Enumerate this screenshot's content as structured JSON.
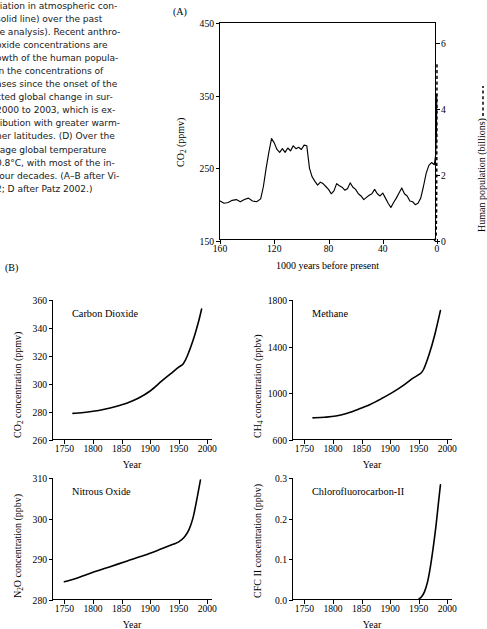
{
  "caption": {
    "lines": [
      "riation in atmospheric con-",
      "solid line) over the past",
      "re analysis). Recent anthro-",
      "oxide concentrations are",
      "owth of the human popula-",
      "in the concentrations of",
      "ases since the onset of the",
      "cted global change in sur-",
      "2000 to 2003, which is ex-",
      "ribution with greater warm-",
      "her latitudes. (D) Over the",
      "rage global temperature",
      "0.8°C, with most of the in-",
      "four decades. (A–B after Vi-",
      "2; D after Patz 2002.)"
    ]
  },
  "panels": {
    "a_letter": "(A)",
    "b_letter": "(B)"
  },
  "chart_data": [
    {
      "id": "panel-a",
      "type": "line",
      "title": "",
      "xlabel": "1000 years before present",
      "ylabel": "CO2 (ppmv)",
      "ylabel_display": "CO₂ (ppmv)",
      "y2label": "Human population (billions)",
      "y2label_legend": "dotted-line",
      "xlim": [
        160,
        0
      ],
      "ylim": [
        150,
        450
      ],
      "y2lim": [
        0,
        6.6
      ],
      "xticks": [
        160,
        120,
        80,
        40,
        0
      ],
      "yticks": [
        150,
        250,
        350,
        450
      ],
      "y2ticks": [
        0,
        2,
        4,
        6
      ],
      "grid": false,
      "frame": true,
      "series": [
        {
          "name": "CO2 concentration",
          "style": "solid",
          "x": [
            160,
            157,
            154,
            151,
            148,
            145,
            142,
            139,
            136,
            133,
            130,
            128,
            126,
            124,
            122,
            120,
            118,
            116,
            114,
            112,
            110,
            108,
            106,
            104,
            102,
            100,
            98,
            96,
            94,
            92,
            90,
            88,
            86,
            84,
            82,
            80,
            78,
            76,
            74,
            72,
            70,
            68,
            66,
            64,
            62,
            60,
            58,
            56,
            54,
            52,
            50,
            48,
            46,
            44,
            42,
            40,
            38,
            36,
            34,
            32,
            30,
            28,
            26,
            24,
            22,
            20,
            18,
            16,
            14,
            12,
            10,
            8,
            6,
            4,
            2,
            1,
            0.4,
            0.2,
            0
          ],
          "y": [
            205,
            202,
            203,
            206,
            207,
            204,
            207,
            209,
            205,
            204,
            208,
            225,
            250,
            272,
            291,
            285,
            276,
            272,
            277,
            272,
            278,
            274,
            281,
            277,
            279,
            276,
            282,
            281,
            250,
            238,
            232,
            227,
            231,
            229,
            225,
            221,
            215,
            219,
            229,
            226,
            224,
            220,
            222,
            230,
            224,
            221,
            215,
            212,
            207,
            210,
            213,
            215,
            221,
            215,
            212,
            216,
            209,
            202,
            196,
            203,
            209,
            216,
            223,
            215,
            212,
            205,
            204,
            200,
            202,
            209,
            225,
            243,
            254,
            258,
            255,
            268,
            300,
            352,
            352
          ]
        },
        {
          "name": "Human population",
          "style": "dashed",
          "x": [
            2.0,
            1.2,
            0.6,
            0.3,
            0.15,
            0.05,
            0
          ],
          "y2": [
            0.0,
            0.05,
            0.2,
            0.9,
            2.4,
            4.3,
            5.4
          ]
        }
      ]
    },
    {
      "id": "panel-b-co2",
      "type": "line",
      "series_label": "Carbon Dioxide",
      "xlabel": "Year",
      "ylabel": "CO2 concentration (ppmv)",
      "ylabel_display": "CO₂ concentration (ppmv)",
      "xlim": [
        1730,
        2010
      ],
      "ylim": [
        260,
        360
      ],
      "xticks": [
        1750,
        1800,
        1850,
        1900,
        1950,
        2000
      ],
      "yticks": [
        260,
        280,
        300,
        320,
        340,
        360
      ],
      "grid": false,
      "x": [
        1765,
        1780,
        1800,
        1820,
        1840,
        1860,
        1880,
        1900,
        1920,
        1935,
        1950,
        1958,
        1965,
        1975,
        1985,
        1990
      ],
      "y": [
        279.0,
        279.5,
        280.5,
        282.0,
        284.0,
        286.5,
        290.0,
        295.0,
        302.0,
        307.0,
        312.0,
        314.5,
        320.0,
        331.0,
        345.0,
        353.5
      ]
    },
    {
      "id": "panel-b-ch4",
      "type": "line",
      "series_label": "Methane",
      "xlabel": "Year",
      "ylabel": "CH4 concentration (ppbv)",
      "ylabel_display": "CH₄ concentration (ppbv)",
      "xlim": [
        1730,
        2010
      ],
      "ylim": [
        600,
        1800
      ],
      "xticks": [
        1750,
        1800,
        1850,
        1900,
        1950,
        2000
      ],
      "yticks": [
        600,
        1000,
        1400,
        1800
      ],
      "grid": false,
      "x": [
        1765,
        1785,
        1805,
        1825,
        1845,
        1865,
        1885,
        1905,
        1925,
        1940,
        1950,
        1958,
        1968,
        1978,
        1988
      ],
      "y": [
        790,
        795,
        805,
        830,
        865,
        905,
        955,
        1010,
        1075,
        1130,
        1160,
        1200,
        1330,
        1500,
        1710
      ]
    },
    {
      "id": "panel-b-n2o",
      "type": "line",
      "series_label": "Nitrous Oxide",
      "xlabel": "Year",
      "ylabel": "N2O concentration (ppbv)",
      "ylabel_display": "N₂O concentration (ppbv)",
      "xlim": [
        1730,
        2010
      ],
      "ylim": [
        280,
        310
      ],
      "xticks": [
        1750,
        1800,
        1850,
        1900,
        1950,
        2000
      ],
      "yticks": [
        280,
        290,
        300,
        310
      ],
      "grid": false,
      "x": [
        1750,
        1770,
        1800,
        1830,
        1860,
        1890,
        1920,
        1940,
        1950,
        1960,
        1968,
        1975,
        1980,
        1985,
        1988
      ],
      "y": [
        284.5,
        285.3,
        286.8,
        288.2,
        289.6,
        291.0,
        292.6,
        293.7,
        294.3,
        295.5,
        297.3,
        300.2,
        303.5,
        307.2,
        309.5
      ]
    },
    {
      "id": "panel-b-cfc",
      "type": "line",
      "series_label": "Chlorofluorocarbon-II",
      "xlabel": "Year",
      "ylabel": "CFC II concentration (ppbv)",
      "ylabel_display": "CFC II concentration (ppbv)",
      "xlim": [
        1730,
        2010
      ],
      "ylim": [
        0.0,
        0.3
      ],
      "xticks": [
        1750,
        1800,
        1850,
        1900,
        1950,
        2000
      ],
      "yticks": [
        "0.0",
        "0.1",
        "0.2",
        "0.3"
      ],
      "grid": false,
      "x": [
        1950,
        1955,
        1960,
        1965,
        1970,
        1975,
        1980,
        1985,
        1988
      ],
      "y": [
        0.002,
        0.008,
        0.02,
        0.042,
        0.078,
        0.125,
        0.18,
        0.245,
        0.283
      ]
    }
  ]
}
